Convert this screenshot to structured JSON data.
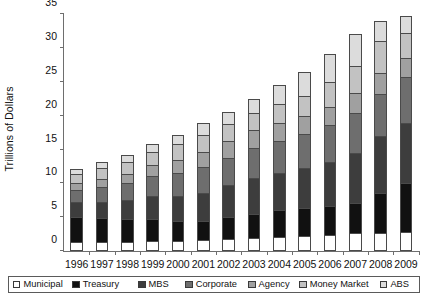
{
  "chart_data": {
    "type": "bar",
    "stacked": true,
    "title": "",
    "xlabel": "",
    "ylabel": "Trillions of Dollars",
    "ylim": [
      0,
      35
    ],
    "ytick_step": 5,
    "yticks": [
      0,
      5,
      10,
      15,
      20,
      25,
      30,
      35
    ],
    "grid": false,
    "legend_position": "bottom",
    "categories": [
      "1996",
      "1997",
      "1998",
      "1999",
      "2000",
      "2001",
      "2002",
      "2003",
      "2004",
      "2005",
      "2006",
      "2007",
      "2008",
      "2009"
    ],
    "series": [
      {
        "name": "Municipal",
        "color": "#ffffff",
        "values": [
          1.3,
          1.3,
          1.4,
          1.5,
          1.5,
          1.6,
          1.8,
          1.9,
          2.0,
          2.2,
          2.4,
          2.6,
          2.7,
          2.8
        ]
      },
      {
        "name": "Treasury",
        "color": "#111111",
        "values": [
          3.7,
          3.6,
          3.4,
          3.3,
          3.0,
          2.9,
          3.2,
          3.6,
          4.0,
          4.2,
          4.3,
          4.5,
          5.9,
          7.3
        ]
      },
      {
        "name": "MBS",
        "color": "#3d3d3d",
        "values": [
          2.2,
          2.4,
          2.7,
          3.3,
          3.6,
          4.1,
          4.7,
          5.3,
          5.5,
          5.9,
          6.5,
          7.4,
          8.4,
          8.9
        ]
      },
      {
        "name": "Corporate",
        "color": "#6e6e6e",
        "values": [
          1.8,
          2.2,
          2.6,
          3.0,
          3.4,
          3.8,
          4.1,
          4.5,
          4.8,
          5.0,
          5.4,
          5.9,
          6.2,
          6.8
        ]
      },
      {
        "name": "Agency",
        "color": "#a0a0a0",
        "values": [
          1.0,
          1.2,
          1.3,
          1.6,
          1.9,
          2.2,
          2.4,
          2.6,
          2.7,
          2.6,
          2.7,
          2.9,
          3.2,
          2.7
        ]
      },
      {
        "name": "Money Market",
        "color": "#c2c2c2",
        "values": [
          1.4,
          1.6,
          1.8,
          2.0,
          2.4,
          2.6,
          2.6,
          2.5,
          2.7,
          3.1,
          3.7,
          4.1,
          4.6,
          3.7
        ]
      },
      {
        "name": "ABS",
        "color": "#dcdcdc",
        "values": [
          0.7,
          0.8,
          1.0,
          1.2,
          1.4,
          1.7,
          1.8,
          2.1,
          2.8,
          3.5,
          4.1,
          4.7,
          3.0,
          2.6
        ]
      }
    ],
    "totals": [
      12.1,
      13.1,
      14.2,
      15.9,
      17.2,
      18.9,
      20.6,
      22.5,
      24.5,
      26.5,
      29.1,
      32.1,
      34.0,
      34.8
    ]
  },
  "legend": {
    "items": [
      {
        "label": "Municipal"
      },
      {
        "label": "Treasury"
      },
      {
        "label": "MBS"
      },
      {
        "label": "Corporate"
      },
      {
        "label": "Agency"
      },
      {
        "label": "Money Market"
      },
      {
        "label": "ABS"
      }
    ]
  },
  "colors": {
    "axis": "#6e6e6e",
    "text": "#111111",
    "background": "#ffffff",
    "segment_border": "#4a4a4a"
  }
}
